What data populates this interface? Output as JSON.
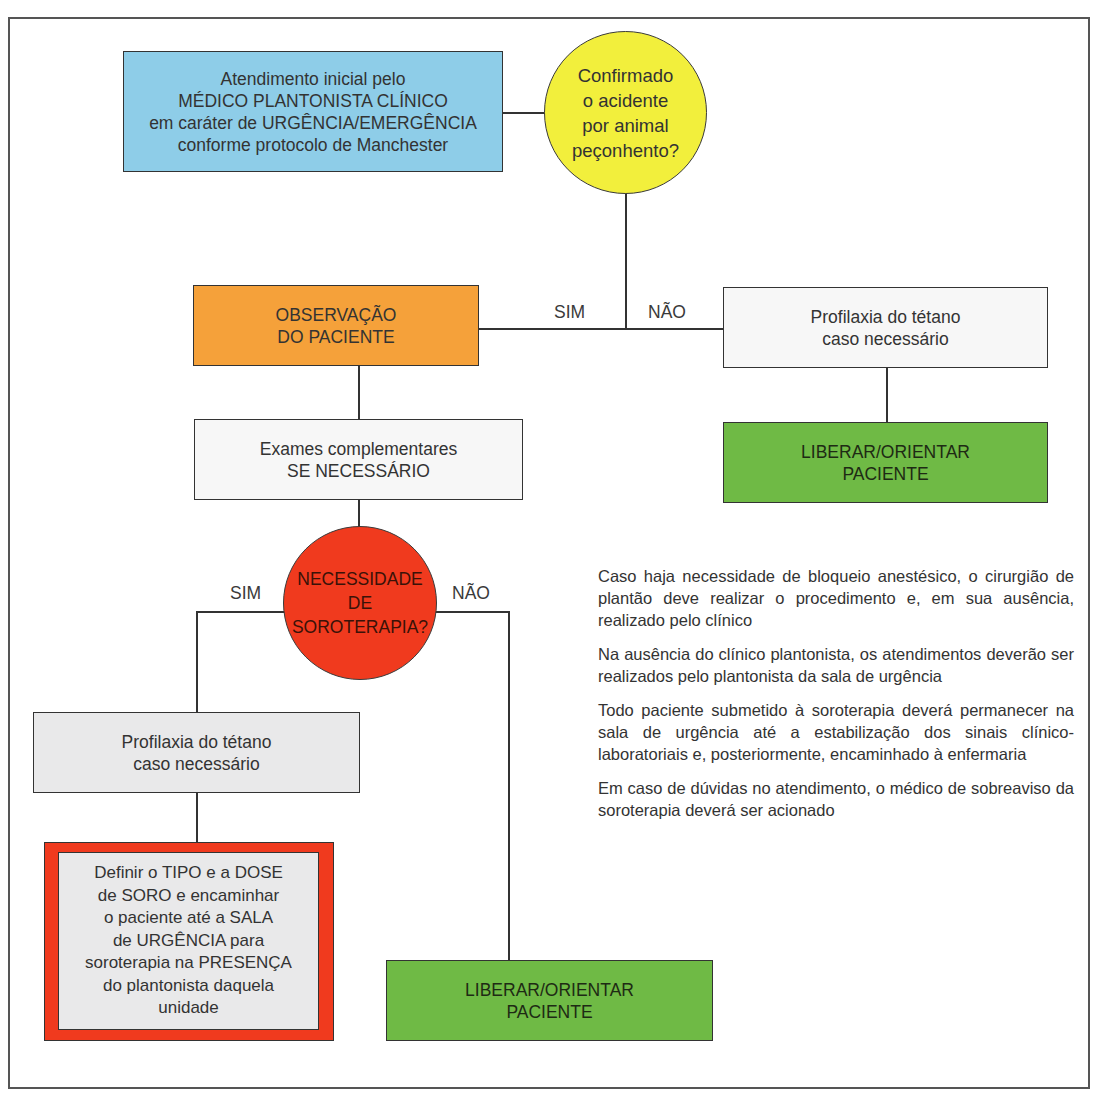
{
  "colors": {
    "blue": "#8ecde8",
    "yellow": "#f2ef3c",
    "orange": "#f5a13a",
    "red": "#f03a1e",
    "green": "#6fba45",
    "light_gray": "#e9e9ea",
    "white_box": "#f7f7f7",
    "line": "#333333"
  },
  "flowchart": {
    "start_box": {
      "text": "Atendimento inicial pelo\nMÉDICO PLANTONISTA CLÍNICO\nem caráter de URGÊNCIA/EMERGÊNCIA\nconforme protocolo de Manchester"
    },
    "decision_1": {
      "text": "Confirmado\no acidente\npor animal\npeçonhento?",
      "yes_label": "SIM",
      "no_label": "NÃO"
    },
    "observation_box": {
      "text": "OBSERVAÇÃO\nDO PACIENTE"
    },
    "tetanus_right_box": {
      "text": "Profilaxia do tétano\ncaso necessário"
    },
    "release_right_box": {
      "text": "LIBERAR/ORIENTAR\nPACIENTE"
    },
    "exams_box": {
      "text": "Exames complementares\nSE NECESSÁRIO"
    },
    "decision_2": {
      "text": "NECESSIDADE\nDE\nSOROTERAPIA?",
      "yes_label": "SIM",
      "no_label": "NÃO"
    },
    "tetanus_left_box": {
      "text": "Profilaxia do tétano\ncaso necessário"
    },
    "serum_box": {
      "text": "Definir o TIPO e a DOSE\nde SORO e encaminhar\no paciente até a SALA\nde URGÊNCIA para\nsoroterapia na PRESENÇA\ndo plantonista daquela\nunidade"
    },
    "release_bottom_box": {
      "text": "LIBERAR/ORIENTAR\nPACIENTE"
    }
  },
  "notes": [
    "Caso haja necessidade de bloqueio anestésico, o cirurgião de plantão deve realizar o procedimento e, em sua ausência, realizado pelo clínico",
    "Na ausência do clínico plantonista, os atendimentos deverão ser realizados pelo plantonista da sala de urgência",
    "Todo paciente submetido à soroterapia deverá permanecer na sala de urgência até a estabilização dos sinais clínico-laboratoriais e, posteriormente, encaminhado à enfermaria",
    "Em caso de dúvidas no atendimento, o médico de sobreaviso da soroterapia deverá ser acionado"
  ]
}
